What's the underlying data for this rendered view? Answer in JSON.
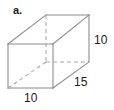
{
  "figure": {
    "part_label": "a.",
    "shape_name": "rectangular-prism",
    "stroke_color": "#8c8c8c",
    "hidden_stroke_color": "#a8a8a8",
    "text_color": "#1a1a1a",
    "background_color": "#ffffff"
  },
  "dimensions": {
    "height": {
      "value": "10",
      "edge": "right-vertical",
      "position": "right"
    },
    "depth": {
      "value": "15",
      "edge": "bottom-right-receding",
      "position": "lower-right"
    },
    "width": {
      "value": "10",
      "edge": "front-bottom",
      "position": "bottom"
    }
  },
  "vertices": {
    "front_top_left": [
      8,
      44
    ],
    "front_top_right": [
      53,
      44
    ],
    "front_bottom_left": [
      8,
      88
    ],
    "front_bottom_right": [
      53,
      88
    ],
    "back_top_left": [
      46,
      15
    ],
    "back_top_right": [
      89,
      15
    ],
    "back_bottom_left": [
      46,
      62
    ],
    "back_bottom_right": [
      89,
      62
    ]
  }
}
